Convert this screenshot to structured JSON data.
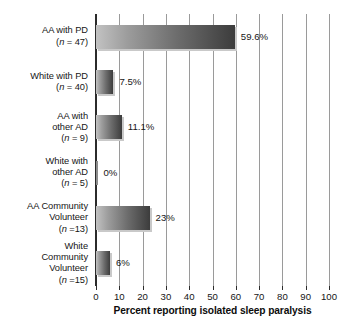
{
  "chart_data": {
    "type": "bar",
    "orientation": "horizontal",
    "title": "",
    "xlabel": "Percent reporting isolated sleep paralysis",
    "ylabel": "",
    "xlim": [
      0,
      100
    ],
    "xticks": [
      "0",
      "10",
      "20",
      "30",
      "40",
      "50",
      "60",
      "70",
      "80",
      "90",
      "100"
    ],
    "grid": "vertical",
    "legend": "none",
    "categories": [
      "AA with PD (n = 47)",
      "White with PD (n = 40)",
      "AA with other AD (n = 9)",
      "White with other AD (n = 5)",
      "AA Community Volunteer (n =13)",
      "White Community Volunteer (n =15)"
    ],
    "values": [
      59.6,
      7.5,
      11.1,
      0,
      23,
      6
    ],
    "value_labels": [
      "59.6%",
      "7.5%",
      "11.1%",
      "0%",
      "23%",
      "6%"
    ],
    "bars": [
      {
        "name_lines": [
          "AA with PD"
        ],
        "n_prefix": "(",
        "n_italic": "n",
        "n_suffix": " = 47)",
        "value": 59.6,
        "value_label": "59.6%"
      },
      {
        "name_lines": [
          "White with PD"
        ],
        "n_prefix": "(",
        "n_italic": "n",
        "n_suffix": " = 40)",
        "value": 7.5,
        "value_label": "7.5%"
      },
      {
        "name_lines": [
          "AA with",
          "other AD"
        ],
        "n_prefix": "(",
        "n_italic": "n",
        "n_suffix": " = 9)",
        "value": 11.1,
        "value_label": "11.1%"
      },
      {
        "name_lines": [
          "White with",
          "other AD"
        ],
        "n_prefix": "(",
        "n_italic": "n",
        "n_suffix": " = 5)",
        "value": 0,
        "value_label": "0%"
      },
      {
        "name_lines": [
          "AA Community",
          "Volunteer"
        ],
        "n_prefix": "(",
        "n_italic": "n",
        "n_suffix": " =13)",
        "value": 23,
        "value_label": "23%"
      },
      {
        "name_lines": [
          "White",
          "Community",
          "Volunteer"
        ],
        "n_prefix": "(",
        "n_italic": "n",
        "n_suffix": " =15)",
        "value": 6,
        "value_label": "6%"
      }
    ],
    "colors": {
      "bar_gradient_light": "#c2c2c2",
      "bar_gradient_dark": "#3c3c3c",
      "bar_shadow": "#c9c9c9",
      "gridline": "#9a9a9a",
      "axis": "#2b2b2b",
      "text": "#161616",
      "background": "#ffffff"
    }
  }
}
